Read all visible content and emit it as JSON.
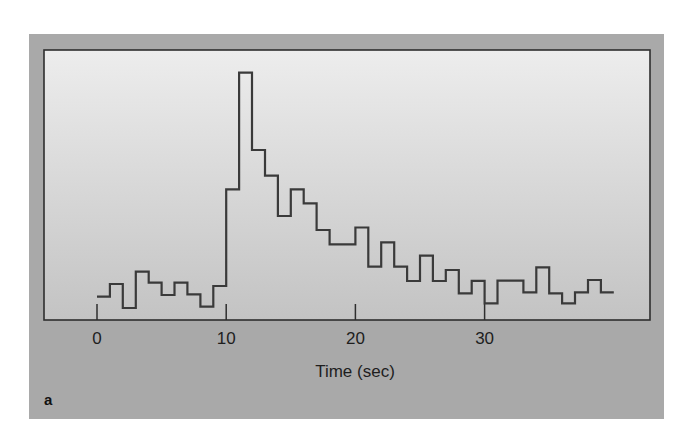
{
  "figure": {
    "panel_label": "a",
    "colors": {
      "frame": "#a9a9a9",
      "plot_top": "#ededed",
      "plot_bottom": "#c3c3c3",
      "line": "#3a3a3a"
    }
  },
  "chart_data": {
    "type": "line",
    "style": "step-histogram",
    "title": "",
    "xlabel": "Time (sec)",
    "ylabel": "",
    "xlim": [
      -4,
      43
    ],
    "x_ticks": [
      0,
      10,
      20,
      30
    ],
    "x_tick_labels": [
      "0",
      "10",
      "20",
      "30"
    ],
    "y_ticks": [],
    "grid": false,
    "legend": null,
    "bin_width_sec": 1,
    "bin_starts": [
      0,
      1,
      2,
      3,
      4,
      5,
      6,
      7,
      8,
      9,
      10,
      11,
      12,
      13,
      14,
      15,
      16,
      17,
      18,
      19,
      20,
      21,
      22,
      23,
      24,
      25,
      26,
      27,
      28,
      29,
      30,
      31,
      32,
      33,
      34,
      35,
      36,
      37,
      38,
      39
    ],
    "values": [
      23.3,
      36,
      12,
      48.3,
      37.3,
      25,
      37.3,
      25.7,
      13.3,
      34,
      130.7,
      247.3,
      170,
      144.3,
      104,
      130.7,
      116.7,
      90,
      75.7,
      75.7,
      92.5,
      53.3,
      77.7,
      53.3,
      39,
      64.3,
      39,
      50,
      26.7,
      39.2,
      16.7,
      39.3,
      39.3,
      27.7,
      52.7,
      26.7,
      16.7,
      27.7,
      40,
      27.7
    ],
    "values_unit": "relative count (unlabeled y-axis; pixel height above baseline)",
    "annotations": [
      "a"
    ]
  }
}
